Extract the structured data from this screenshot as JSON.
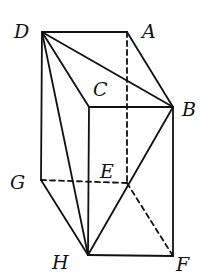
{
  "diagram": {
    "points": {
      "D": {
        "label": "D",
        "x": 42,
        "y": 32,
        "lx": 14,
        "ly": 22
      },
      "A": {
        "label": "A",
        "x": 127,
        "y": 32,
        "lx": 142,
        "ly": 22
      },
      "C": {
        "label": "C",
        "x": 89,
        "y": 107,
        "lx": 93,
        "ly": 80
      },
      "B": {
        "label": "B",
        "x": 173,
        "y": 107,
        "lx": 182,
        "ly": 100
      },
      "G": {
        "label": "G",
        "x": 41,
        "y": 180,
        "lx": 10,
        "ly": 173
      },
      "E": {
        "label": "E",
        "x": 127,
        "y": 183,
        "lx": 100,
        "ly": 162
      },
      "H": {
        "label": "H",
        "x": 88,
        "y": 255,
        "lx": 52,
        "ly": 253
      },
      "F": {
        "label": "F",
        "x": 173,
        "y": 256,
        "lx": 176,
        "ly": 255
      }
    },
    "solid_edges": [
      [
        "D",
        "A"
      ],
      [
        "A",
        "B"
      ],
      [
        "D",
        "B"
      ],
      [
        "D",
        "C"
      ],
      [
        "C",
        "B"
      ],
      [
        "D",
        "H"
      ],
      [
        "D",
        "G"
      ],
      [
        "C",
        "H"
      ],
      [
        "B",
        "F"
      ],
      [
        "B",
        "H"
      ],
      [
        "G",
        "H"
      ],
      [
        "H",
        "F"
      ]
    ],
    "dashed_edges": [
      [
        "A",
        "E"
      ],
      [
        "G",
        "E"
      ],
      [
        "E",
        "F"
      ]
    ]
  }
}
